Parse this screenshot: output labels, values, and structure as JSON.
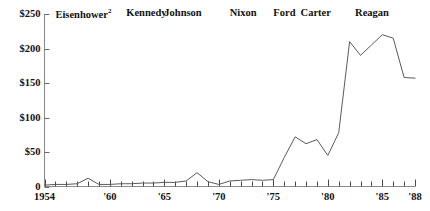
{
  "chart_data": {
    "type": "line",
    "title": "",
    "xlabel": "",
    "ylabel": "",
    "ylim": [
      0,
      250
    ],
    "xlim": [
      1954,
      1988
    ],
    "grid": false,
    "legend": "none",
    "ytick_labels": [
      "$250",
      "$200",
      "$150",
      "$100",
      "$50",
      "0"
    ],
    "ytick_values": [
      250,
      200,
      150,
      100,
      50,
      0
    ],
    "xtick_labels": [
      "1954",
      "'60",
      "'65",
      "'70",
      "'75",
      "'80",
      "'85",
      "'88"
    ],
    "xtick_values": [
      1954,
      1960,
      1965,
      1970,
      1975,
      1980,
      1985,
      1988
    ],
    "annotations": [
      {
        "label": "Eisenhower",
        "superscript": "2",
        "x": 1955.0
      },
      {
        "label": "Kennedy",
        "x": 1961.5
      },
      {
        "label": "Johnson",
        "x": 1965.0
      },
      {
        "label": "Nixon",
        "x": 1971.0
      },
      {
        "label": "Ford",
        "x": 1975.0
      },
      {
        "label": "Carter",
        "x": 1977.5
      },
      {
        "label": "Reagan",
        "x": 1982.5
      }
    ],
    "x": [
      1954,
      1955,
      1956,
      1957,
      1958,
      1959,
      1960,
      1961,
      1962,
      1963,
      1964,
      1965,
      1966,
      1967,
      1968,
      1969,
      1970,
      1971,
      1972,
      1973,
      1974,
      1975,
      1976,
      1977,
      1978,
      1979,
      1980,
      1981,
      1982,
      1983,
      1984,
      1985,
      1986,
      1987,
      1988
    ],
    "values": [
      2,
      3,
      3,
      4,
      12,
      3,
      3,
      4,
      4,
      5,
      5,
      6,
      6,
      8,
      20,
      7,
      3,
      8,
      9,
      10,
      9,
      10,
      42,
      72,
      62,
      68,
      45,
      78,
      210,
      190,
      205,
      220,
      215,
      158,
      157
    ],
    "series": [
      {
        "name": "",
        "values": [
          2,
          3,
          3,
          4,
          12,
          3,
          3,
          4,
          4,
          5,
          5,
          6,
          6,
          8,
          20,
          7,
          3,
          8,
          9,
          10,
          9,
          10,
          42,
          72,
          62,
          68,
          45,
          78,
          210,
          190,
          205,
          220,
          215,
          158,
          157
        ]
      }
    ]
  },
  "axis": {
    "y_top_label": "$250",
    "x_start_label": "1954",
    "x_end_label": "'88"
  }
}
